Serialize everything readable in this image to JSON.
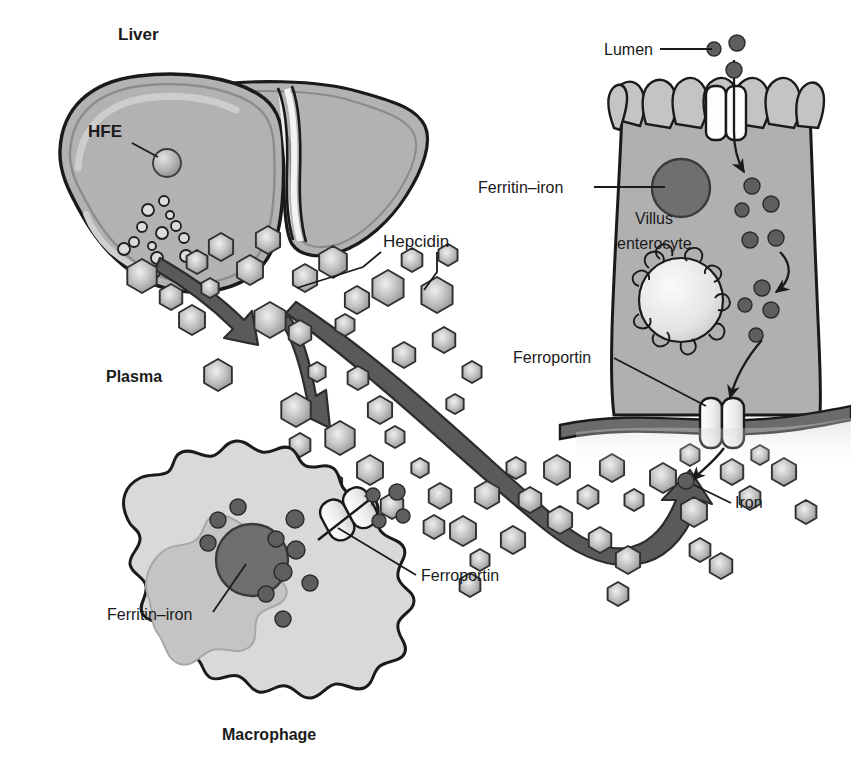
{
  "figure": {
    "background_color": "#ffffff",
    "width": 851,
    "height": 769
  },
  "palette": {
    "outline": "#1a1a1a",
    "liver_fill": "#b2b2b2",
    "liver_fill_dark": "#9a9a9a",
    "liver_highlight": "#c9c9c9",
    "enterocyte_fill": "#b0b0b0",
    "enterocyte_microvilli": "#c2c2c2",
    "macrophage_fill": "#d6d6d6",
    "macrophage_inner": "#bfbfbf",
    "nucleus_fill": "#6f6f6f",
    "iron_dot": "#5e5e5e",
    "hexagon_center": "#e8e8e8",
    "hexagon_edge": "#8f8f8f",
    "arrow_fill": "#595959",
    "basement_membrane": "#6b6b6b",
    "channel_fill": "#f2f2f2",
    "text": "#1a1a1a"
  },
  "labels": {
    "liver": "Liver",
    "hfe": "HFE",
    "plasma": "Plasma",
    "hepcidin": "Hepcidin",
    "macrophage": "Macrophage",
    "ferritin_iron_macrophage": "Ferritin–iron",
    "ferroportin_macrophage": "Ferroportin",
    "lumen": "Lumen",
    "ferritin_iron_enterocyte": "Ferritin–iron",
    "villus_line1": "Villus",
    "villus_line2": "enterocyte",
    "ferroportin_enterocyte": "Ferroportin",
    "iron": "Iron"
  },
  "label_positions": {
    "liver": {
      "x": 118,
      "y": 40,
      "size": 17,
      "bold": true,
      "anchor": "start"
    },
    "hfe": {
      "x": 88,
      "y": 137,
      "size": 17,
      "bold": true,
      "anchor": "start"
    },
    "plasma": {
      "x": 106,
      "y": 382,
      "size": 16,
      "bold": true,
      "anchor": "start"
    },
    "hepcidin": {
      "x": 383,
      "y": 247,
      "size": 17,
      "bold": false,
      "anchor": "start"
    },
    "macrophage": {
      "x": 222,
      "y": 740,
      "size": 16,
      "bold": true,
      "anchor": "start"
    },
    "ferritin_iron_macrophage": {
      "x": 107,
      "y": 620,
      "size": 16,
      "bold": false,
      "anchor": "start"
    },
    "ferroportin_macrophage": {
      "x": 421,
      "y": 581,
      "size": 16,
      "bold": false,
      "anchor": "start"
    },
    "lumen": {
      "x": 604,
      "y": 55,
      "size": 16,
      "bold": false,
      "anchor": "start"
    },
    "ferritin_iron_enterocyte": {
      "x": 478,
      "y": 191,
      "size": 16,
      "bold": false,
      "anchor": "start"
    },
    "villus_line1": {
      "x": 635,
      "y": 224,
      "size": 16,
      "bold": false,
      "anchor": "start"
    },
    "villus_line2": {
      "x": 617,
      "y": 249,
      "size": 16,
      "bold": false,
      "anchor": "start"
    },
    "ferroportin_enterocyte": {
      "x": 513,
      "y": 363,
      "size": 16,
      "bold": false,
      "anchor": "start"
    },
    "iron": {
      "x": 735,
      "y": 508,
      "size": 16,
      "bold": false,
      "anchor": "start"
    }
  },
  "leader_lines": [
    {
      "name": "hfe-leader",
      "x1": 132,
      "y1": 143,
      "x2": 158,
      "y2": 157
    },
    {
      "name": "hepcidin-leader-left",
      "points": "381,252 363,267 297,288"
    },
    {
      "name": "hepcidin-leader-right",
      "points": "437,252 437,272 424,290"
    },
    {
      "name": "lumen-leader",
      "x1": 660,
      "y1": 49,
      "x2": 712,
      "y2": 49
    },
    {
      "name": "ferritin-ent-leader",
      "x1": 594,
      "y1": 187,
      "x2": 665,
      "y2": 187
    },
    {
      "name": "ferroportin-ent-leader",
      "x1": 614,
      "y1": 358,
      "x2": 705,
      "y2": 405
    },
    {
      "name": "iron-leader",
      "x1": 731,
      "y1": 503,
      "x2": 694,
      "y2": 485
    },
    {
      "name": "ferritin-mac-leader",
      "x1": 213,
      "y1": 612,
      "x2": 244,
      "y2": 566
    },
    {
      "name": "ferroportin-mac-leader",
      "x1": 416,
      "y1": 575,
      "x2": 340,
      "y2": 528
    }
  ],
  "chart_data": {
    "type": "diagram",
    "entities": [
      {
        "name": "Liver",
        "role": "hepcidin-producing organ"
      },
      {
        "name": "HFE",
        "role": "hemochromatosis protein within hepatocyte"
      },
      {
        "name": "Hepcidin",
        "role": "hormone, drawn as hexagons in plasma"
      },
      {
        "name": "Plasma",
        "role": "compartment containing hepcidin hexagons"
      },
      {
        "name": "Macrophage",
        "role": "iron-recycling cell"
      },
      {
        "name": "Ferritin–iron",
        "role": "iron storage complex (dark circle)"
      },
      {
        "name": "Ferroportin",
        "role": "iron export channel in membrane"
      },
      {
        "name": "Villus enterocyte",
        "role": "intestinal absorptive cell"
      },
      {
        "name": "Lumen",
        "role": "intestinal lumen, source of dietary iron"
      },
      {
        "name": "Iron",
        "role": "iron atoms, drawn as small dark circles"
      }
    ],
    "flows": [
      {
        "from": "Liver",
        "to": "Plasma",
        "label": "hepcidin secretion",
        "style": "thick curved arrow"
      },
      {
        "from": "Plasma hepcidin",
        "to": "Macrophage ferroportin",
        "label": "inhibits iron export",
        "style": "thick curved arrow"
      },
      {
        "from": "Plasma hepcidin",
        "to": "Enterocyte ferroportin",
        "label": "inhibits iron export",
        "style": "thick curved arrow"
      },
      {
        "from": "Lumen",
        "to": "Villus enterocyte",
        "label": "iron uptake",
        "style": "thin arrow"
      },
      {
        "from": "Villus enterocyte",
        "to": "Plasma",
        "label": "iron export via ferroportin",
        "style": "thin arrow"
      },
      {
        "from": "Macrophage",
        "to": "Plasma",
        "label": "iron export via ferroportin",
        "style": "thin arrow"
      }
    ],
    "counts": {
      "hepcidin_hexagons": 62,
      "iron_dots_enterocyte": 13,
      "iron_dots_macrophage": 12,
      "iron_dots_lumen": 3
    }
  },
  "hexagons": [
    {
      "cx": 142,
      "cy": 276,
      "r": 17
    },
    {
      "cx": 197,
      "cy": 262,
      "r": 12
    },
    {
      "cx": 221,
      "cy": 247,
      "r": 14
    },
    {
      "cx": 171,
      "cy": 297,
      "r": 13
    },
    {
      "cx": 192,
      "cy": 320,
      "r": 15
    },
    {
      "cx": 210,
      "cy": 288,
      "r": 10
    },
    {
      "cx": 250,
      "cy": 270,
      "r": 15
    },
    {
      "cx": 270,
      "cy": 320,
      "r": 18
    },
    {
      "cx": 268,
      "cy": 240,
      "r": 14
    },
    {
      "cx": 305,
      "cy": 278,
      "r": 14
    },
    {
      "cx": 333,
      "cy": 262,
      "r": 16
    },
    {
      "cx": 357,
      "cy": 300,
      "r": 14
    },
    {
      "cx": 300,
      "cy": 333,
      "r": 13
    },
    {
      "cx": 345,
      "cy": 325,
      "r": 11
    },
    {
      "cx": 388,
      "cy": 288,
      "r": 18
    },
    {
      "cx": 412,
      "cy": 260,
      "r": 12
    },
    {
      "cx": 437,
      "cy": 295,
      "r": 18
    },
    {
      "cx": 448,
      "cy": 255,
      "r": 11
    },
    {
      "cx": 404,
      "cy": 355,
      "r": 13
    },
    {
      "cx": 317,
      "cy": 372,
      "r": 10
    },
    {
      "cx": 218,
      "cy": 375,
      "r": 16
    },
    {
      "cx": 296,
      "cy": 410,
      "r": 17
    },
    {
      "cx": 358,
      "cy": 378,
      "r": 12
    },
    {
      "cx": 380,
      "cy": 410,
      "r": 14
    },
    {
      "cx": 444,
      "cy": 340,
      "r": 13
    },
    {
      "cx": 472,
      "cy": 372,
      "r": 11
    },
    {
      "cx": 455,
      "cy": 404,
      "r": 10
    },
    {
      "cx": 340,
      "cy": 438,
      "r": 17
    },
    {
      "cx": 300,
      "cy": 445,
      "r": 12
    },
    {
      "cx": 395,
      "cy": 437,
      "r": 11
    },
    {
      "cx": 370,
      "cy": 470,
      "r": 15
    },
    {
      "cx": 420,
      "cy": 468,
      "r": 10
    },
    {
      "cx": 330,
      "cy": 485,
      "r": 14
    },
    {
      "cx": 392,
      "cy": 506,
      "r": 13
    },
    {
      "cx": 350,
      "cy": 520,
      "r": 14
    },
    {
      "cx": 440,
      "cy": 496,
      "r": 13
    },
    {
      "cx": 434,
      "cy": 527,
      "r": 12
    },
    {
      "cx": 463,
      "cy": 531,
      "r": 15
    },
    {
      "cx": 480,
      "cy": 560,
      "r": 11
    },
    {
      "cx": 513,
      "cy": 540,
      "r": 14
    },
    {
      "cx": 487,
      "cy": 495,
      "r": 14
    },
    {
      "cx": 516,
      "cy": 468,
      "r": 11
    },
    {
      "cx": 530,
      "cy": 500,
      "r": 13
    },
    {
      "cx": 560,
      "cy": 520,
      "r": 14
    },
    {
      "cx": 557,
      "cy": 470,
      "r": 15
    },
    {
      "cx": 588,
      "cy": 497,
      "r": 12
    },
    {
      "cx": 612,
      "cy": 468,
      "r": 14
    },
    {
      "cx": 634,
      "cy": 500,
      "r": 11
    },
    {
      "cx": 600,
      "cy": 540,
      "r": 13
    },
    {
      "cx": 628,
      "cy": 560,
      "r": 14
    },
    {
      "cx": 663,
      "cy": 478,
      "r": 15
    },
    {
      "cx": 690,
      "cy": 455,
      "r": 11
    },
    {
      "cx": 732,
      "cy": 472,
      "r": 13
    },
    {
      "cx": 760,
      "cy": 455,
      "r": 10
    },
    {
      "cx": 694,
      "cy": 512,
      "r": 15
    },
    {
      "cx": 750,
      "cy": 498,
      "r": 12
    },
    {
      "cx": 784,
      "cy": 472,
      "r": 14
    },
    {
      "cx": 700,
      "cy": 550,
      "r": 12
    },
    {
      "cx": 721,
      "cy": 566,
      "r": 13
    },
    {
      "cx": 618,
      "cy": 594,
      "r": 12
    },
    {
      "cx": 806,
      "cy": 512,
      "r": 12
    },
    {
      "cx": 470,
      "cy": 585,
      "r": 12
    }
  ],
  "iron_dots": {
    "lumen": [
      {
        "cx": 714,
        "cy": 49,
        "r": 7
      },
      {
        "cx": 737,
        "cy": 43,
        "r": 8
      },
      {
        "cx": 734,
        "cy": 70,
        "r": 8
      }
    ],
    "enterocyte": [
      {
        "cx": 752,
        "cy": 186,
        "r": 8
      },
      {
        "cx": 742,
        "cy": 210,
        "r": 7
      },
      {
        "cx": 771,
        "cy": 204,
        "r": 8
      },
      {
        "cx": 750,
        "cy": 240,
        "r": 8
      },
      {
        "cx": 776,
        "cy": 238,
        "r": 8
      },
      {
        "cx": 762,
        "cy": 288,
        "r": 8
      },
      {
        "cx": 745,
        "cy": 305,
        "r": 7
      },
      {
        "cx": 771,
        "cy": 310,
        "r": 8
      },
      {
        "cx": 756,
        "cy": 335,
        "r": 7
      }
    ],
    "macrophage": [
      {
        "cx": 218,
        "cy": 520,
        "r": 8
      },
      {
        "cx": 238,
        "cy": 507,
        "r": 8
      },
      {
        "cx": 208,
        "cy": 543,
        "r": 8
      },
      {
        "cx": 295,
        "cy": 519,
        "r": 9
      },
      {
        "cx": 276,
        "cy": 539,
        "r": 8
      },
      {
        "cx": 296,
        "cy": 550,
        "r": 9
      },
      {
        "cx": 283,
        "cy": 572,
        "r": 9
      },
      {
        "cx": 266,
        "cy": 594,
        "r": 8
      },
      {
        "cx": 310,
        "cy": 583,
        "r": 8
      },
      {
        "cx": 283,
        "cy": 619,
        "r": 8
      }
    ],
    "exported_macrophage": [
      {
        "cx": 373,
        "cy": 495,
        "r": 7
      },
      {
        "cx": 397,
        "cy": 492,
        "r": 8
      },
      {
        "cx": 379,
        "cy": 521,
        "r": 7
      },
      {
        "cx": 403,
        "cy": 516,
        "r": 7
      }
    ],
    "exported_enterocyte": [
      {
        "cx": 686,
        "cy": 481,
        "r": 8
      }
    ]
  },
  "hfe_particles": [
    {
      "cx": 164,
      "cy": 201,
      "r": 5
    },
    {
      "cx": 148,
      "cy": 210,
      "r": 6
    },
    {
      "cx": 170,
      "cy": 215,
      "r": 4
    },
    {
      "cx": 142,
      "cy": 227,
      "r": 5
    },
    {
      "cx": 162,
      "cy": 233,
      "r": 6
    },
    {
      "cx": 134,
      "cy": 242,
      "r": 5
    },
    {
      "cx": 152,
      "cy": 246,
      "r": 4
    },
    {
      "cx": 176,
      "cy": 226,
      "r": 5
    },
    {
      "cx": 124,
      "cy": 249,
      "r": 6
    },
    {
      "cx": 157,
      "cy": 258,
      "r": 6
    },
    {
      "cx": 184,
      "cy": 238,
      "r": 5
    },
    {
      "cx": 186,
      "cy": 256,
      "r": 6
    },
    {
      "cx": 154,
      "cy": 272,
      "r": 6
    }
  ]
}
